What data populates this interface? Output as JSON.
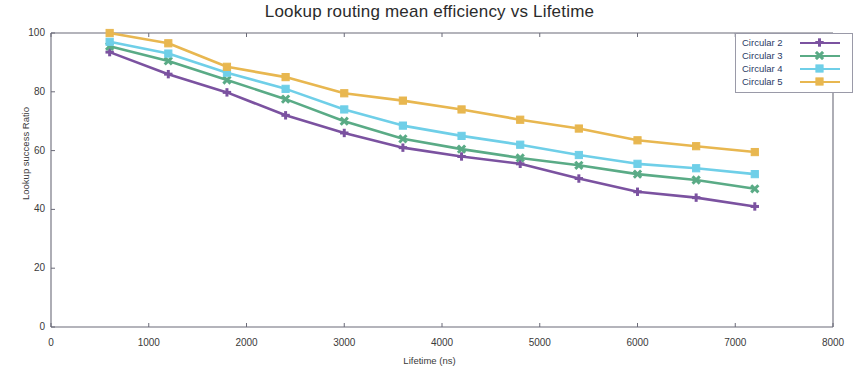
{
  "chart_data": {
    "type": "line",
    "title": "Lookup routing mean efficiency vs Lifetime",
    "xlabel": "Lifetime (ns)",
    "ylabel": "Lookup success Ratio",
    "xlim": [
      0,
      8000
    ],
    "ylim": [
      0,
      100
    ],
    "xticks": [
      0,
      1000,
      2000,
      3000,
      4000,
      5000,
      6000,
      7000,
      8000
    ],
    "yticks": [
      0,
      20,
      40,
      60,
      80,
      100
    ],
    "grid": false,
    "legend_position": "upper-right",
    "x": [
      600,
      1200,
      1800,
      2400,
      3000,
      3600,
      4200,
      4800,
      5400,
      6000,
      6600,
      7200
    ],
    "series": [
      {
        "name": "Circular 2",
        "color": "#7b52a0",
        "marker": "plus",
        "values": [
          93.5,
          86.0,
          79.8,
          72.0,
          66.0,
          61.0,
          58.0,
          55.5,
          50.5,
          46.0,
          44.0,
          41.0
        ]
      },
      {
        "name": "Circular 3",
        "color": "#5aab86",
        "marker": "x",
        "values": [
          95.5,
          90.5,
          84.0,
          77.5,
          70.0,
          64.0,
          60.5,
          57.5,
          55.0,
          52.0,
          50.0,
          47.0
        ]
      },
      {
        "name": "Circular 4",
        "color": "#6fcfe8",
        "marker": "square",
        "values": [
          97.0,
          93.0,
          86.5,
          81.0,
          74.0,
          68.5,
          65.0,
          62.0,
          58.5,
          55.5,
          54.0,
          52.0
        ]
      },
      {
        "name": "Circular 5",
        "color": "#e8b750",
        "marker": "square",
        "values": [
          100.0,
          96.5,
          88.5,
          85.0,
          79.5,
          77.0,
          74.0,
          70.5,
          67.5,
          63.5,
          61.5,
          59.5
        ]
      }
    ]
  }
}
